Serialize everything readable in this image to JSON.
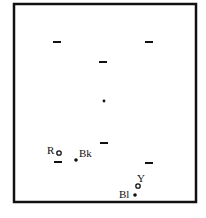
{
  "diagram": {
    "frame_color": "#111111",
    "mark_color": "#111111",
    "background": "#ffffff",
    "marks": [
      {
        "kind": "dash",
        "id": "dash-upper-left"
      },
      {
        "kind": "dash",
        "id": "dash-upper-right"
      },
      {
        "kind": "dash",
        "id": "dash-upper-center"
      },
      {
        "kind": "dot",
        "id": "dot-center"
      },
      {
        "kind": "dash",
        "id": "dash-lower-center"
      },
      {
        "kind": "dash",
        "id": "dash-lower-left"
      },
      {
        "kind": "dash",
        "id": "dash-lower-right"
      },
      {
        "kind": "open-circle",
        "id": "marker-r",
        "label": "R"
      },
      {
        "kind": "filled-dot",
        "id": "marker-bk",
        "label": "Bk"
      },
      {
        "kind": "open-circle",
        "id": "marker-y",
        "label": "Y"
      },
      {
        "kind": "filled-dot",
        "id": "marker-bl",
        "label": "Bl"
      }
    ],
    "labels": {
      "r": "R",
      "bk": "Bk",
      "y": "Y",
      "bl": "Bl"
    }
  }
}
